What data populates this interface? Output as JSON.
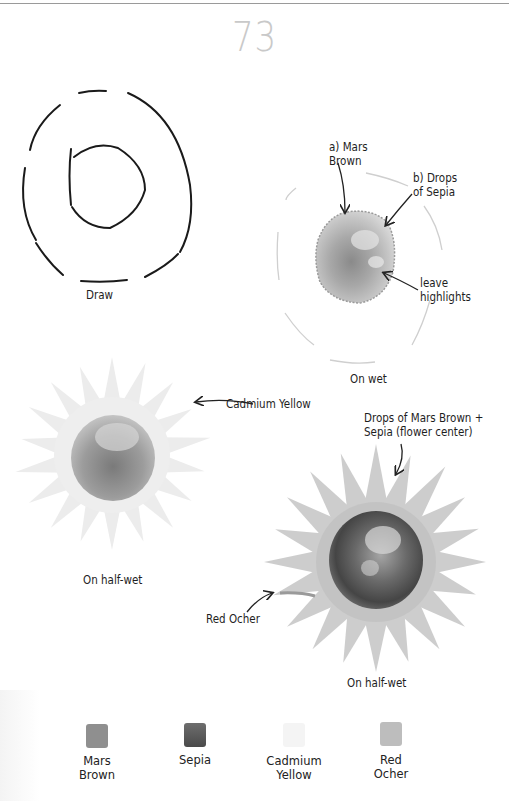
{
  "page": {
    "number": "73"
  },
  "steps": [
    {
      "id": "draw",
      "caption": "Draw"
    },
    {
      "id": "on-wet",
      "caption": "On wet",
      "annotations": [
        {
          "text_lines": [
            "a) Mars",
            "Brown"
          ]
        },
        {
          "text_lines": [
            "b) Drops",
            "of Sepia"
          ]
        },
        {
          "text_lines": [
            "leave",
            "highlights"
          ]
        }
      ]
    },
    {
      "id": "half-wet-1",
      "caption": "On half-wet",
      "annotations": [
        {
          "text_lines": [
            "Cadmium Yellow"
          ]
        }
      ]
    },
    {
      "id": "half-wet-2",
      "caption": "On half-wet",
      "annotations": [
        {
          "text_lines": [
            "Drops of Mars Brown +",
            "Sepia (flower center)"
          ]
        },
        {
          "text_lines": [
            "Red Ocher"
          ]
        }
      ]
    }
  ],
  "palette": [
    {
      "name_lines": [
        "Mars",
        "Brown"
      ],
      "color": "#8f8f8f"
    },
    {
      "name_lines": [
        "Sepia",
        ""
      ],
      "color": "#5e5e5e"
    },
    {
      "name_lines": [
        "Cadmium",
        "Yellow"
      ],
      "color": "#f4f4f4"
    },
    {
      "name_lines": [
        "Red",
        "Ocher"
      ],
      "color": "#bdbdbd"
    }
  ]
}
